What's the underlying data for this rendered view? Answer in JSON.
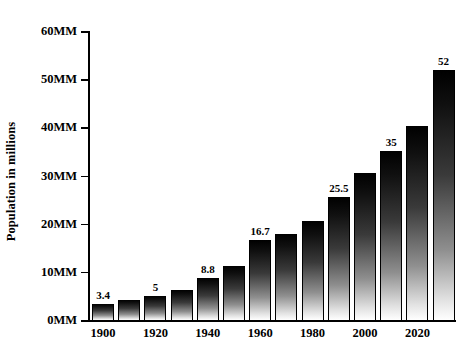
{
  "chart_data": {
    "type": "bar",
    "title": "",
    "xlabel": "",
    "ylabel": "Population in millions",
    "ylim": [
      0,
      60
    ],
    "ytick_values": [
      0,
      10,
      20,
      30,
      40,
      50,
      60
    ],
    "ytick_labels": [
      "0MM",
      "10MM",
      "20MM",
      "30MM",
      "40MM",
      "50MM",
      "60MM"
    ],
    "xtick_labels": [
      "1900",
      "1920",
      "1940",
      "1960",
      "1980",
      "2000",
      "2020"
    ],
    "grid": false,
    "legend": null,
    "categories": [
      "1900",
      "1910",
      "1920",
      "1930",
      "1940",
      "1950",
      "1960",
      "1970",
      "1980",
      "1990",
      "2000",
      "2010",
      "2020"
    ],
    "values": [
      3.4,
      4.2,
      5,
      6.3,
      8.8,
      11.2,
      16.7,
      17.8,
      20.5,
      25.5,
      30.6,
      35,
      40.2
    ],
    "bars": [
      {
        "year": "1900",
        "value": 3.4,
        "label": "3.4",
        "show_label": true,
        "show_xtick": true
      },
      {
        "year": "1910",
        "value": 4.2,
        "label": "",
        "show_label": false,
        "show_xtick": false
      },
      {
        "year": "1920",
        "value": 5,
        "label": "5",
        "show_label": true,
        "show_xtick": true
      },
      {
        "year": "1930",
        "value": 6.3,
        "label": "",
        "show_label": false,
        "show_xtick": false
      },
      {
        "year": "1940",
        "value": 8.8,
        "label": "8.8",
        "show_label": true,
        "show_xtick": true
      },
      {
        "year": "1950",
        "value": 11.2,
        "label": "",
        "show_label": false,
        "show_xtick": false
      },
      {
        "year": "1960",
        "value": 16.7,
        "label": "16.7",
        "show_label": true,
        "show_xtick": true
      },
      {
        "year": "1970",
        "value": 17.8,
        "label": "",
        "show_label": false,
        "show_xtick": false
      },
      {
        "year": "1980",
        "value": 20.5,
        "label": "25.5",
        "show_label": false,
        "show_xtick": true
      },
      {
        "year": "1990",
        "value": 25.5,
        "label": "25.5",
        "show_label": true,
        "show_xtick": false
      },
      {
        "year": "2000",
        "value": 30.6,
        "label": "",
        "show_label": false,
        "show_xtick": true
      },
      {
        "year": "2010",
        "value": 35,
        "label": "35",
        "show_label": true,
        "show_xtick": false
      },
      {
        "year": "2020",
        "value": 40.2,
        "label": "",
        "show_label": false,
        "show_xtick": true
      },
      {
        "year": "",
        "value": 52,
        "label": "52",
        "show_label": true,
        "show_xtick": false
      }
    ],
    "bar_style": {
      "gradient_top": "#000000",
      "gradient_bottom": "#ffffff",
      "outline": "#000000"
    },
    "background": "#ffffff",
    "text_color": "#000000"
  }
}
